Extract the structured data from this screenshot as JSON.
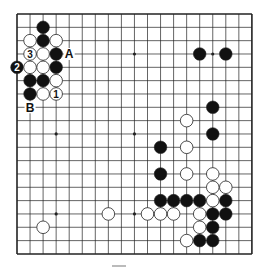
{
  "diagram": {
    "type": "go-board",
    "size": 19,
    "colors": {
      "background": "#ffffff",
      "grid": "#222222",
      "black_stone": "#111111",
      "white_stone": "#ffffff",
      "stone_outline": "#222222"
    },
    "star_points": [
      [
        3,
        3
      ],
      [
        9,
        3
      ],
      [
        15,
        3
      ],
      [
        3,
        9
      ],
      [
        9,
        9
      ],
      [
        15,
        9
      ],
      [
        3,
        15
      ],
      [
        9,
        15
      ],
      [
        15,
        15
      ]
    ],
    "black_stones": [
      {
        "col": 2,
        "row": 1
      },
      {
        "col": 2,
        "row": 2
      },
      {
        "col": 3,
        "row": 3
      },
      {
        "col": 0,
        "row": 4,
        "label": "2"
      },
      {
        "col": 3,
        "row": 4
      },
      {
        "col": 1,
        "row": 5
      },
      {
        "col": 2,
        "row": 5
      },
      {
        "col": 1,
        "row": 6
      },
      {
        "col": 14,
        "row": 3
      },
      {
        "col": 16,
        "row": 3
      },
      {
        "col": 15,
        "row": 7
      },
      {
        "col": 15,
        "row": 9
      },
      {
        "col": 11,
        "row": 10
      },
      {
        "col": 11,
        "row": 12
      },
      {
        "col": 11,
        "row": 14
      },
      {
        "col": 12,
        "row": 14
      },
      {
        "col": 13,
        "row": 14
      },
      {
        "col": 14,
        "row": 14
      },
      {
        "col": 16,
        "row": 14
      },
      {
        "col": 15,
        "row": 15
      },
      {
        "col": 16,
        "row": 15
      },
      {
        "col": 15,
        "row": 16
      },
      {
        "col": 14,
        "row": 17
      },
      {
        "col": 15,
        "row": 17
      }
    ],
    "white_stones": [
      {
        "col": 1,
        "row": 2
      },
      {
        "col": 3,
        "row": 2
      },
      {
        "col": 1,
        "row": 3,
        "label": "3"
      },
      {
        "col": 2,
        "row": 3
      },
      {
        "col": 1,
        "row": 4
      },
      {
        "col": 2,
        "row": 4
      },
      {
        "col": 3,
        "row": 5
      },
      {
        "col": 2,
        "row": 6
      },
      {
        "col": 3,
        "row": 6,
        "label": "1"
      },
      {
        "col": 13,
        "row": 8
      },
      {
        "col": 13,
        "row": 10
      },
      {
        "col": 13,
        "row": 12
      },
      {
        "col": 15,
        "row": 12
      },
      {
        "col": 15,
        "row": 13
      },
      {
        "col": 16,
        "row": 13
      },
      {
        "col": 15,
        "row": 14
      },
      {
        "col": 7,
        "row": 15
      },
      {
        "col": 10,
        "row": 15
      },
      {
        "col": 11,
        "row": 15
      },
      {
        "col": 12,
        "row": 15
      },
      {
        "col": 14,
        "row": 15
      },
      {
        "col": 14,
        "row": 16
      },
      {
        "col": 2,
        "row": 16
      },
      {
        "col": 13,
        "row": 17
      }
    ],
    "point_labels": [
      {
        "col": 4,
        "row": 3,
        "text": "A"
      },
      {
        "col": 1,
        "row": 7,
        "text": "B"
      }
    ]
  }
}
